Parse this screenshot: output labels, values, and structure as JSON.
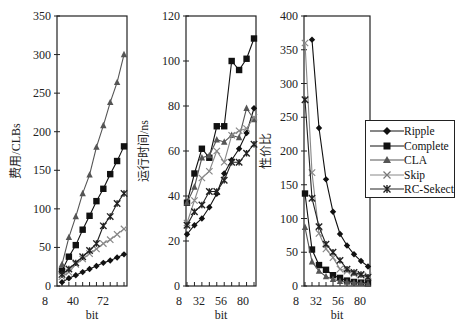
{
  "chart_data": [
    {
      "type": "line",
      "title": "",
      "xlabel": "bit",
      "ylabel": "费用/CLBs",
      "ylim": [
        0,
        350
      ],
      "yticks": [
        0,
        50,
        100,
        150,
        200,
        250,
        300,
        350
      ],
      "xtick_labels": [
        "8",
        "40",
        "72"
      ],
      "x": [
        16,
        24,
        32,
        40,
        48,
        56,
        64,
        72,
        80,
        88
      ],
      "series": [
        {
          "name": "Ripple",
          "values": [
            5,
            10,
            14,
            18,
            22,
            26,
            30,
            33,
            37,
            41
          ]
        },
        {
          "name": "Complete",
          "values": [
            20,
            38,
            53,
            73,
            91,
            110,
            126,
            145,
            162,
            181
          ]
        },
        {
          "name": "CLA",
          "values": [
            28,
            63,
            90,
            120,
            144,
            180,
            208,
            238,
            264,
            300
          ]
        },
        {
          "name": "Skip",
          "values": [
            12,
            18,
            28,
            35,
            42,
            48,
            55,
            60,
            67,
            74
          ]
        },
        {
          "name": "RC-Sekect",
          "values": [
            15,
            22,
            30,
            38,
            46,
            55,
            78,
            90,
            107,
            120
          ]
        }
      ]
    },
    {
      "type": "line",
      "title": "",
      "xlabel": "bit",
      "ylabel": "运行时间/ns",
      "ylim": [
        0,
        120
      ],
      "yticks": [
        0,
        20,
        40,
        60,
        80,
        100,
        120
      ],
      "xtick_labels": [
        "8",
        "32",
        "56",
        "80"
      ],
      "x": [
        16,
        24,
        32,
        40,
        48,
        56,
        64,
        72,
        80,
        88
      ],
      "series": [
        {
          "name": "Ripple",
          "values": [
            23,
            27,
            30,
            35,
            41,
            50,
            56,
            61,
            68,
            79
          ]
        },
        {
          "name": "Complete",
          "values": [
            37,
            50,
            61,
            57,
            71,
            71,
            100,
            96,
            101,
            110
          ]
        },
        {
          "name": "CLA",
          "values": [
            37,
            44,
            57,
            58,
            65,
            64,
            67,
            66,
            79,
            74
          ]
        },
        {
          "name": "Skip",
          "values": [
            28,
            38,
            48,
            51,
            60,
            55,
            67,
            69,
            70,
            75
          ]
        },
        {
          "name": "RC-Sekect",
          "values": [
            27,
            33,
            36,
            42,
            42,
            47,
            55,
            55,
            59,
            63
          ]
        }
      ]
    },
    {
      "type": "line",
      "title": "",
      "xlabel": "bit",
      "ylabel": "性价比",
      "ylim": [
        0,
        400
      ],
      "yticks": [
        0,
        50,
        100,
        150,
        200,
        250,
        300,
        350,
        400
      ],
      "xtick_labels": [
        "8",
        "32",
        "56",
        "80"
      ],
      "x": [
        16,
        24,
        32,
        40,
        48,
        56,
        64,
        72,
        80,
        88
      ],
      "series": [
        {
          "name": "Ripple",
          "values": [
            null,
            365,
            234,
            158,
            110,
            77,
            60,
            47,
            37,
            29
          ]
        },
        {
          "name": "Complete",
          "values": [
            137,
            54,
            31,
            24,
            16,
            12,
            8,
            6,
            5,
            4
          ]
        },
        {
          "name": "CLA",
          "values": [
            87,
            36,
            22,
            14,
            10,
            7,
            6,
            5,
            4,
            3
          ]
        },
        {
          "name": "Skip",
          "values": [
            360,
            168,
            78,
            55,
            42,
            25,
            22,
            18,
            16,
            15
          ]
        },
        {
          "name": "RC-Sekect",
          "values": [
            276,
            130,
            88,
            62,
            50,
            38,
            25,
            20,
            17,
            13
          ]
        }
      ]
    }
  ],
  "legend": {
    "items": [
      {
        "label": "Ripple",
        "marker": "diamond",
        "color": "#111111"
      },
      {
        "label": "Complete",
        "marker": "square",
        "color": "#111111"
      },
      {
        "label": "CLA",
        "marker": "triangle",
        "color": "#555555"
      },
      {
        "label": "Skip",
        "marker": "x",
        "color": "#777777"
      },
      {
        "label": "RC-Sekect",
        "marker": "star",
        "color": "#222222"
      }
    ]
  }
}
